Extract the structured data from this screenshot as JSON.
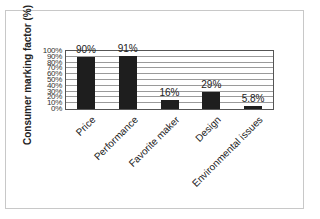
{
  "chart_data": {
    "type": "bar",
    "title": "",
    "xlabel": "",
    "ylabel": "Consumer marking factor (%)",
    "categories": [
      "Price",
      "Performance",
      "Favorite maker",
      "Design",
      "Environmental issues"
    ],
    "values": [
      90,
      91,
      16,
      29,
      5.8
    ],
    "value_labels": [
      "90%",
      "91%",
      "16%",
      "29%",
      "5.8%"
    ],
    "ylim": [
      0,
      100
    ],
    "yticks": [
      "0%",
      "10%",
      "20%",
      "30%",
      "40%",
      "50%",
      "60%",
      "70%",
      "80%",
      "90%",
      "100%"
    ],
    "grid": true,
    "legend": null,
    "bar_color": "#1e1e1e"
  }
}
